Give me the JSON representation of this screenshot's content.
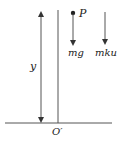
{
  "diagram": {
    "labels": {
      "point": "P",
      "weight_force": "mg",
      "drag_force": "mku",
      "height": "y",
      "origin": "O′"
    },
    "colors": {
      "line": "#555555",
      "arrowhead": "#333333",
      "text": "#222222",
      "background": "#ffffff"
    }
  }
}
